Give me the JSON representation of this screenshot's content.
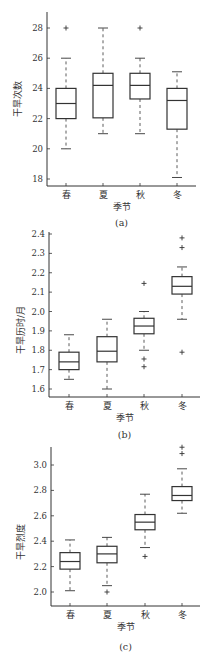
{
  "chart_data": [
    {
      "type": "box",
      "panel_label": "(a)",
      "xlabel": "季节",
      "ylabel": "干旱次数",
      "categories": [
        "春",
        "夏",
        "秋",
        "冬"
      ],
      "ylim": [
        17.5,
        28.6
      ],
      "yticks": [
        18,
        20,
        22,
        24,
        26,
        28
      ],
      "ytick_labels": [
        "18",
        "20",
        "22",
        "24",
        "26",
        "28"
      ],
      "grid": false,
      "boxes": [
        {
          "category": "春",
          "whisker_low": 20,
          "q1": 22,
          "median": 23,
          "q3": 24,
          "whisker_high": 26,
          "outliers": [
            28
          ]
        },
        {
          "category": "夏",
          "whisker_low": 21,
          "q1": 22.05,
          "median": 24.2,
          "q3": 25,
          "whisker_high": 28,
          "outliers": []
        },
        {
          "category": "秋",
          "whisker_low": 21,
          "q1": 23.3,
          "median": 24.2,
          "q3": 25,
          "whisker_high": 26,
          "outliers": [
            28
          ]
        },
        {
          "category": "冬",
          "whisker_low": 18.1,
          "q1": 21.3,
          "median": 23.2,
          "q3": 24,
          "whisker_high": 25.1,
          "outliers": []
        }
      ]
    },
    {
      "type": "box",
      "panel_label": "(b)",
      "xlabel": "季节",
      "ylabel": "干旱历时/月",
      "categories": [
        "春",
        "夏",
        "秋",
        "冬"
      ],
      "ylim": [
        1.57,
        2.42
      ],
      "yticks": [
        1.6,
        1.7,
        1.8,
        1.9,
        2.0,
        2.1,
        2.2,
        2.3,
        2.4
      ],
      "ytick_labels": [
        "1.6",
        "1.7",
        "1.8",
        "1.9",
        "2.0",
        "2.1",
        "2.2",
        "2.3",
        "2.4"
      ],
      "grid": false,
      "boxes": [
        {
          "category": "春",
          "whisker_low": 1.65,
          "q1": 1.7,
          "median": 1.74,
          "q3": 1.79,
          "whisker_high": 1.88,
          "outliers": []
        },
        {
          "category": "夏",
          "whisker_low": 1.6,
          "q1": 1.74,
          "median": 1.795,
          "q3": 1.87,
          "whisker_high": 1.96,
          "outliers": []
        },
        {
          "category": "秋",
          "whisker_low": 1.8,
          "q1": 1.885,
          "median": 1.925,
          "q3": 1.965,
          "whisker_high": 2.0,
          "outliers": [
            2.145,
            1.755,
            1.715
          ]
        },
        {
          "category": "冬",
          "whisker_low": 1.96,
          "q1": 2.09,
          "median": 2.13,
          "q3": 2.18,
          "whisker_high": 2.23,
          "outliers": [
            2.38,
            2.33,
            1.79
          ]
        }
      ]
    },
    {
      "type": "box",
      "panel_label": "(c)",
      "xlabel": "季节",
      "ylabel": "干旱烈度",
      "categories": [
        "春",
        "夏",
        "秋",
        "冬"
      ],
      "ylim": [
        1.89,
        3.2
      ],
      "yticks": [
        2.0,
        2.2,
        2.4,
        2.6,
        2.8,
        3.0
      ],
      "ytick_labels": [
        "2.0",
        "2.2",
        "2.4",
        "2.6",
        "2.8",
        "3.0"
      ],
      "grid": false,
      "boxes": [
        {
          "category": "春",
          "whisker_low": 2.01,
          "q1": 2.18,
          "median": 2.24,
          "q3": 2.31,
          "whisker_high": 2.41,
          "outliers": []
        },
        {
          "category": "夏",
          "whisker_low": 2.05,
          "q1": 2.23,
          "median": 2.3,
          "q3": 2.36,
          "whisker_high": 2.43,
          "outliers": [
            2.0
          ]
        },
        {
          "category": "秋",
          "whisker_low": 2.35,
          "q1": 2.49,
          "median": 2.55,
          "q3": 2.61,
          "whisker_high": 2.77,
          "outliers": [
            2.28
          ]
        },
        {
          "category": "冬",
          "whisker_low": 2.62,
          "q1": 2.72,
          "median": 2.76,
          "q3": 2.83,
          "whisker_high": 2.97,
          "outliers": [
            3.14,
            3.09
          ]
        }
      ]
    }
  ],
  "layout": {
    "panels": [
      {
        "axis_x": 47,
        "top": 12,
        "bottom": 186,
        "right": 196,
        "y_of": {
          "v0": 28,
          "p0": 28,
          "v1": 18,
          "p1": 179
        },
        "cat_x": [
          66,
          103,
          140,
          177
        ],
        "cat_label_y": 198,
        "xlabel_y": 210,
        "caption_y": 226,
        "ylabel_x": 18,
        "ylabel_cy": 99
      },
      {
        "axis_x": 49,
        "top": 232,
        "bottom": 397,
        "right": 200,
        "y_of": {
          "v0": 2.4,
          "p0": 234,
          "v1": 1.6,
          "p1": 389
        },
        "cat_x": [
          69,
          107,
          144,
          182
        ],
        "cat_label_y": 409,
        "xlabel_y": 421,
        "caption_y": 438,
        "ylabel_x": 21,
        "ylabel_cy": 330
      },
      {
        "axis_x": 51,
        "top": 447,
        "bottom": 606,
        "right": 200,
        "y_of": {
          "v0": 3.0,
          "p0": 465,
          "v1": 2.0,
          "p1": 592
        },
        "cat_x": [
          70,
          107,
          145,
          182
        ],
        "cat_label_y": 618,
        "xlabel_y": 630,
        "caption_y": 650,
        "ylabel_x": 21,
        "ylabel_cy": 542
      }
    ],
    "box_half_width": 10,
    "cap_half_width": 5,
    "line_color": "#333333",
    "whisker_dash": "3,3"
  }
}
